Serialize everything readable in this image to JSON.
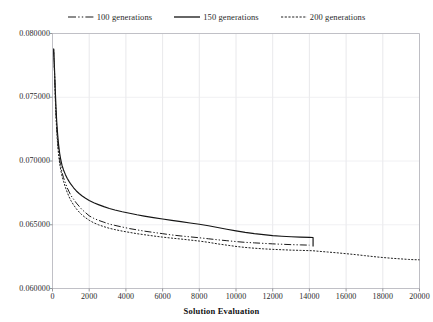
{
  "chart_data": {
    "type": "line",
    "title": "",
    "xlabel": "Solution Evaluation",
    "ylabel": "",
    "xlim": [
      0,
      20000
    ],
    "ylim": [
      0.06,
      0.08
    ],
    "grid": true,
    "legend_position": "top-center",
    "x_ticks": [
      0,
      2000,
      4000,
      6000,
      8000,
      10000,
      12000,
      14000,
      16000,
      18000,
      20000
    ],
    "x_tick_labels": [
      "0",
      "2000",
      "4000",
      "6000",
      "8000",
      "10000",
      "12000",
      "14000",
      "16000",
      "18000",
      "20000"
    ],
    "y_ticks": [
      0.06,
      0.065,
      0.07,
      0.075,
      0.08
    ],
    "y_tick_labels": [
      "0.060000",
      "0.065000",
      "0.070000",
      "0.075000",
      "0.080000"
    ],
    "series": [
      {
        "name": "100 generations",
        "legend_label": "100 generations",
        "style": "dash-dot",
        "color": "#1a1a1a",
        "points": [
          [
            60,
            0.0788
          ],
          [
            110,
            0.077
          ],
          [
            150,
            0.0752
          ],
          [
            190,
            0.0738
          ],
          [
            230,
            0.0726
          ],
          [
            280,
            0.0716
          ],
          [
            330,
            0.0708
          ],
          [
            390,
            0.0701
          ],
          [
            450,
            0.0696
          ],
          [
            520,
            0.0691
          ],
          [
            600,
            0.0687
          ],
          [
            700,
            0.0683
          ],
          [
            800,
            0.0679
          ],
          [
            900,
            0.0676
          ],
          [
            1000,
            0.0673
          ],
          [
            1150,
            0.067
          ],
          [
            1300,
            0.0667
          ],
          [
            1450,
            0.06645
          ],
          [
            1600,
            0.0662
          ],
          [
            1800,
            0.06595
          ],
          [
            2000,
            0.0657
          ],
          [
            2250,
            0.0655
          ],
          [
            2500,
            0.06535
          ],
          [
            2800,
            0.0652
          ],
          [
            3100,
            0.06505
          ],
          [
            3400,
            0.06495
          ],
          [
            3800,
            0.06482
          ],
          [
            4200,
            0.0647
          ],
          [
            4600,
            0.0646
          ],
          [
            5000,
            0.0645
          ],
          [
            5500,
            0.0644
          ],
          [
            6000,
            0.0643
          ],
          [
            6500,
            0.0642
          ],
          [
            7000,
            0.06412
          ],
          [
            7500,
            0.06405
          ],
          [
            8000,
            0.06398
          ],
          [
            8500,
            0.0639
          ],
          [
            9000,
            0.06382
          ],
          [
            9500,
            0.06375
          ],
          [
            10000,
            0.06368
          ],
          [
            10500,
            0.06362
          ],
          [
            11000,
            0.06358
          ],
          [
            11500,
            0.06354
          ],
          [
            12000,
            0.0635
          ],
          [
            12500,
            0.06347
          ],
          [
            13000,
            0.06344
          ],
          [
            13500,
            0.06342
          ],
          [
            14000,
            0.0634
          ]
        ]
      },
      {
        "name": "150 generations",
        "legend_label": "150 generations",
        "style": "solid",
        "color": "#141414",
        "points": [
          [
            60,
            0.0788
          ],
          [
            110,
            0.0772
          ],
          [
            150,
            0.0756
          ],
          [
            190,
            0.0742
          ],
          [
            230,
            0.0731
          ],
          [
            280,
            0.0721
          ],
          [
            330,
            0.0713
          ],
          [
            390,
            0.0706
          ],
          [
            450,
            0.0701
          ],
          [
            520,
            0.06965
          ],
          [
            600,
            0.0693
          ],
          [
            700,
            0.06895
          ],
          [
            800,
            0.06865
          ],
          [
            900,
            0.0684
          ],
          [
            1000,
            0.06818
          ],
          [
            1150,
            0.0679
          ],
          [
            1300,
            0.06765
          ],
          [
            1450,
            0.06745
          ],
          [
            1600,
            0.06728
          ],
          [
            1800,
            0.06708
          ],
          [
            2000,
            0.0669
          ],
          [
            2250,
            0.06672
          ],
          [
            2500,
            0.06658
          ],
          [
            2800,
            0.06642
          ],
          [
            3100,
            0.06628
          ],
          [
            3400,
            0.06616
          ],
          [
            3800,
            0.06602
          ],
          [
            4200,
            0.0659
          ],
          [
            4600,
            0.06578
          ],
          [
            5000,
            0.06568
          ],
          [
            5500,
            0.06556
          ],
          [
            6000,
            0.06545
          ],
          [
            6500,
            0.06534
          ],
          [
            7000,
            0.06524
          ],
          [
            7500,
            0.06514
          ],
          [
            8000,
            0.06504
          ],
          [
            8500,
            0.06492
          ],
          [
            9000,
            0.06478
          ],
          [
            9500,
            0.06465
          ],
          [
            10000,
            0.06452
          ],
          [
            10500,
            0.0644
          ],
          [
            11000,
            0.0643
          ],
          [
            11500,
            0.06422
          ],
          [
            12000,
            0.06415
          ],
          [
            12500,
            0.0641
          ],
          [
            13000,
            0.06406
          ],
          [
            13500,
            0.06403
          ],
          [
            14000,
            0.06401
          ],
          [
            14200,
            0.064
          ]
        ],
        "terminates_with_vertical_drop_at_x": 14200,
        "drop_to_value": 0.0633
      },
      {
        "name": "200 generations",
        "legend_label": "200 generations",
        "style": "dotted",
        "color": "#202020",
        "points": [
          [
            60,
            0.0788
          ],
          [
            110,
            0.0769
          ],
          [
            150,
            0.075
          ],
          [
            190,
            0.0735
          ],
          [
            230,
            0.0723
          ],
          [
            280,
            0.0713
          ],
          [
            330,
            0.0705
          ],
          [
            390,
            0.0698
          ],
          [
            450,
            0.0693
          ],
          [
            520,
            0.0688
          ],
          [
            600,
            0.0684
          ],
          [
            700,
            0.06795
          ],
          [
            800,
            0.06755
          ],
          [
            900,
            0.0672
          ],
          [
            1000,
            0.0669
          ],
          [
            1150,
            0.06655
          ],
          [
            1300,
            0.06625
          ],
          [
            1450,
            0.066
          ],
          [
            1600,
            0.06578
          ],
          [
            1800,
            0.06555
          ],
          [
            2000,
            0.06535
          ],
          [
            2250,
            0.06515
          ],
          [
            2500,
            0.065
          ],
          [
            2800,
            0.06485
          ],
          [
            3100,
            0.06472
          ],
          [
            3400,
            0.06462
          ],
          [
            3800,
            0.0645
          ],
          [
            4200,
            0.0644
          ],
          [
            4600,
            0.0643
          ],
          [
            5000,
            0.06422
          ],
          [
            5500,
            0.06412
          ],
          [
            6000,
            0.06403
          ],
          [
            6500,
            0.06395
          ],
          [
            7000,
            0.06388
          ],
          [
            7500,
            0.0638
          ],
          [
            8000,
            0.06372
          ],
          [
            8500,
            0.06362
          ],
          [
            9000,
            0.0635
          ],
          [
            9500,
            0.0634
          ],
          [
            10000,
            0.0633
          ],
          [
            10500,
            0.06322
          ],
          [
            11000,
            0.06316
          ],
          [
            11500,
            0.06311
          ],
          [
            12000,
            0.06307
          ],
          [
            12500,
            0.06304
          ],
          [
            13000,
            0.06301
          ],
          [
            13500,
            0.06299
          ],
          [
            14000,
            0.06297
          ],
          [
            14200,
            0.06296
          ],
          [
            14500,
            0.06292
          ],
          [
            15000,
            0.06286
          ],
          [
            15500,
            0.0628
          ],
          [
            16000,
            0.06273
          ],
          [
            16500,
            0.06266
          ],
          [
            17000,
            0.06258
          ],
          [
            17500,
            0.0625
          ],
          [
            18000,
            0.06243
          ],
          [
            18500,
            0.06237
          ],
          [
            19000,
            0.06232
          ],
          [
            19400,
            0.06228
          ],
          [
            19700,
            0.06226
          ],
          [
            20000,
            0.06225
          ]
        ]
      }
    ]
  }
}
